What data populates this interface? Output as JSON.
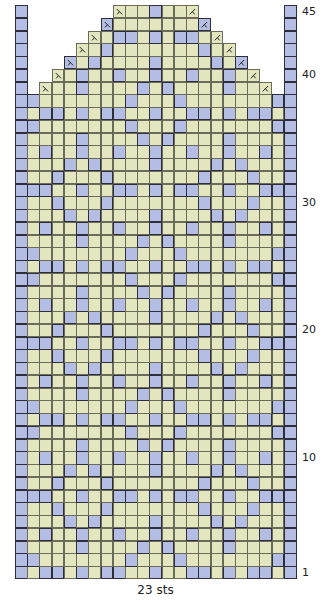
{
  "chart_data": {
    "type": "table",
    "xlabel": "23 sts",
    "ylabel": "rows",
    "columns": 23,
    "rows": 45,
    "row_labels": [
      1,
      10,
      20,
      30,
      40,
      45
    ],
    "colors": {
      "background": "#e3e6bf",
      "contrast": "#b4bee4",
      "grid": "#6b6b5a"
    },
    "legend": {
      "decrease_left_symbol": "ssk (left-slanting decrease)",
      "decrease_right_symbol": "k2tog (right-slanting decrease)"
    },
    "grid": [
      {
        "row": 1,
        "span": [
          0,
          22
        ],
        "blue": [
          0,
          2,
          3,
          5,
          7,
          8,
          11,
          14,
          15,
          17,
          19,
          20,
          22
        ]
      },
      {
        "row": 2,
        "span": [
          0,
          22
        ],
        "blue": [
          0,
          1,
          9,
          13,
          21,
          22
        ]
      },
      {
        "row": 3,
        "span": [
          0,
          22
        ],
        "blue": [
          0,
          5,
          10,
          12,
          17,
          22
        ]
      },
      {
        "row": 4,
        "span": [
          0,
          22
        ],
        "blue": [
          0,
          2,
          5,
          8,
          11,
          14,
          17,
          20,
          22
        ]
      },
      {
        "row": 5,
        "span": [
          0,
          22
        ],
        "blue": [
          0,
          4,
          6,
          11,
          16,
          18,
          22
        ]
      },
      {
        "row": 6,
        "span": [
          0,
          22
        ],
        "blue": [
          0,
          3,
          7,
          15,
          19,
          22
        ]
      },
      {
        "row": 7,
        "span": [
          0,
          22
        ],
        "blue": [
          0,
          1,
          2,
          5,
          8,
          9,
          11,
          13,
          14,
          17,
          20,
          21,
          22
        ]
      },
      {
        "row": 8,
        "span": [
          0,
          22
        ],
        "blue": [
          0,
          3,
          7,
          15,
          19,
          22
        ]
      },
      {
        "row": 9,
        "span": [
          0,
          22
        ],
        "blue": [
          0,
          4,
          6,
          11,
          16,
          18,
          22
        ]
      },
      {
        "row": 10,
        "span": [
          0,
          22
        ],
        "blue": [
          0,
          2,
          5,
          8,
          11,
          14,
          17,
          20,
          22
        ]
      },
      {
        "row": 11,
        "span": [
          0,
          22
        ],
        "blue": [
          0,
          5,
          10,
          12,
          17,
          22
        ]
      },
      {
        "row": 12,
        "span": [
          0,
          22
        ],
        "blue": [
          0,
          1,
          9,
          13,
          21,
          22
        ]
      },
      {
        "row": 13,
        "span": [
          0,
          22
        ],
        "blue": [
          0,
          2,
          3,
          5,
          7,
          8,
          11,
          14,
          15,
          17,
          19,
          20,
          22
        ]
      },
      {
        "row": 14,
        "span": [
          0,
          22
        ],
        "blue": [
          0,
          1,
          9,
          13,
          21,
          22
        ]
      },
      {
        "row": 15,
        "span": [
          0,
          22
        ],
        "blue": [
          0,
          5,
          10,
          12,
          17,
          22
        ]
      },
      {
        "row": 16,
        "span": [
          0,
          22
        ],
        "blue": [
          0,
          2,
          5,
          8,
          11,
          14,
          17,
          20,
          22
        ]
      },
      {
        "row": 17,
        "span": [
          0,
          22
        ],
        "blue": [
          0,
          4,
          6,
          11,
          16,
          18,
          22
        ]
      },
      {
        "row": 18,
        "span": [
          0,
          22
        ],
        "blue": [
          0,
          3,
          7,
          15,
          19,
          22
        ]
      },
      {
        "row": 19,
        "span": [
          0,
          22
        ],
        "blue": [
          0,
          1,
          2,
          5,
          8,
          9,
          11,
          13,
          14,
          17,
          20,
          21,
          22
        ]
      },
      {
        "row": 20,
        "span": [
          0,
          22
        ],
        "blue": [
          0,
          3,
          7,
          15,
          19,
          22
        ]
      },
      {
        "row": 21,
        "span": [
          0,
          22
        ],
        "blue": [
          0,
          4,
          6,
          11,
          16,
          18,
          22
        ]
      },
      {
        "row": 22,
        "span": [
          0,
          22
        ],
        "blue": [
          0,
          2,
          5,
          8,
          11,
          14,
          17,
          20,
          22
        ]
      },
      {
        "row": 23,
        "span": [
          0,
          22
        ],
        "blue": [
          0,
          5,
          10,
          12,
          17,
          22
        ]
      },
      {
        "row": 24,
        "span": [
          0,
          22
        ],
        "blue": [
          0,
          1,
          9,
          13,
          21,
          22
        ]
      },
      {
        "row": 25,
        "span": [
          0,
          22
        ],
        "blue": [
          0,
          2,
          3,
          5,
          7,
          8,
          11,
          14,
          15,
          17,
          19,
          20,
          22
        ]
      },
      {
        "row": 26,
        "span": [
          0,
          22
        ],
        "blue": [
          0,
          1,
          9,
          13,
          21,
          22
        ]
      },
      {
        "row": 27,
        "span": [
          0,
          22
        ],
        "blue": [
          0,
          5,
          10,
          12,
          17,
          22
        ]
      },
      {
        "row": 28,
        "span": [
          0,
          22
        ],
        "blue": [
          0,
          2,
          5,
          8,
          11,
          14,
          17,
          20,
          22
        ]
      },
      {
        "row": 29,
        "span": [
          0,
          22
        ],
        "blue": [
          0,
          4,
          6,
          11,
          16,
          18,
          22
        ]
      },
      {
        "row": 30,
        "span": [
          0,
          22
        ],
        "blue": [
          0,
          3,
          7,
          15,
          19,
          22
        ]
      },
      {
        "row": 31,
        "span": [
          0,
          22
        ],
        "blue": [
          0,
          1,
          2,
          5,
          8,
          9,
          11,
          13,
          14,
          17,
          20,
          21,
          22
        ]
      },
      {
        "row": 32,
        "span": [
          0,
          22
        ],
        "blue": [
          0,
          3,
          7,
          15,
          19,
          22
        ]
      },
      {
        "row": 33,
        "span": [
          0,
          22
        ],
        "blue": [
          0,
          4,
          6,
          11,
          16,
          18,
          22
        ]
      },
      {
        "row": 34,
        "span": [
          0,
          22
        ],
        "blue": [
          0,
          2,
          5,
          8,
          11,
          14,
          17,
          20,
          22
        ]
      },
      {
        "row": 35,
        "span": [
          0,
          22
        ],
        "blue": [
          0,
          5,
          10,
          12,
          17,
          22
        ]
      },
      {
        "row": 36,
        "span": [
          0,
          22
        ],
        "blue": [
          0,
          1,
          9,
          13,
          21,
          22
        ]
      },
      {
        "row": 37,
        "span": [
          0,
          22
        ],
        "blue": [
          0,
          2,
          3,
          5,
          7,
          8,
          11,
          14,
          15,
          17,
          19,
          20,
          22
        ]
      },
      {
        "row": 38,
        "span": [
          0,
          22
        ],
        "blue": [
          0,
          1,
          9,
          13,
          21,
          22
        ]
      },
      {
        "row": 39,
        "span": [
          2,
          20
        ],
        "blue": [
          5,
          10,
          12,
          17
        ],
        "edge": [
          0,
          22
        ]
      },
      {
        "row": 40,
        "span": [
          3,
          19
        ],
        "blue": [
          5,
          8,
          11,
          14,
          17
        ],
        "edge": [
          0,
          22
        ]
      },
      {
        "row": 41,
        "span": [
          4,
          18
        ],
        "blue": [
          4,
          6,
          11,
          16,
          18
        ],
        "edge": [
          0,
          22
        ]
      },
      {
        "row": 42,
        "span": [
          5,
          17
        ],
        "blue": [
          7,
          15
        ],
        "edge": [
          0,
          22
        ]
      },
      {
        "row": 43,
        "span": [
          6,
          16
        ],
        "blue": [
          8,
          9,
          11,
          13,
          14
        ],
        "edge": [
          0,
          22
        ]
      },
      {
        "row": 44,
        "span": [
          7,
          15
        ],
        "blue": [
          7,
          15
        ],
        "edge": [
          0,
          22
        ]
      },
      {
        "row": 45,
        "span": [
          8,
          14
        ],
        "blue": [
          11
        ],
        "edge": [
          0,
          22
        ]
      }
    ],
    "decrease_rows": [
      39,
      40,
      41,
      42,
      43,
      44,
      45
    ]
  },
  "footer": {
    "stitch_count": "23 sts"
  }
}
